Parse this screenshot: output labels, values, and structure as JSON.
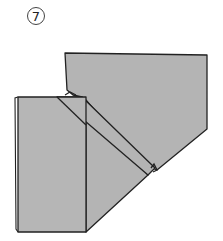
{
  "diagram": {
    "step_label": "7",
    "fill_color": "#b4b4b4",
    "stroke_color": "#222222"
  }
}
